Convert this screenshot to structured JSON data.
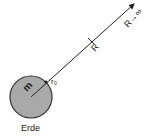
{
  "diagram": {
    "planet": {
      "label": "Erde",
      "mass_label": "m",
      "fill": "#a9a9a9",
      "stroke": "#333333"
    },
    "radius_label": "r₀",
    "distance_label": "R",
    "infinity_label": "R→∞",
    "line_color": "#222222"
  }
}
